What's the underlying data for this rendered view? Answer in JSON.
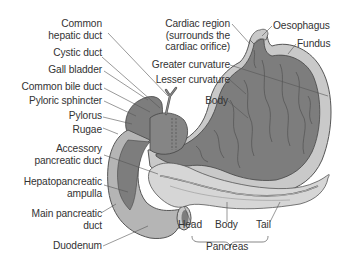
{
  "colors": {
    "mucosa": "#7d7d7d",
    "wall": "#c9c9c9",
    "wall_outline": "#555555",
    "duodenum_light": "#b5b5b5",
    "pancreas": "#d6d6d6",
    "text": "#333333",
    "leader": "#555555"
  },
  "labels_left": [
    {
      "id": "common-hepatic-duct",
      "lines": [
        "Common",
        "hepatic duct"
      ]
    },
    {
      "id": "cystic-duct",
      "lines": [
        "Cystic duct"
      ]
    },
    {
      "id": "gall-bladder",
      "lines": [
        "Gall bladder"
      ]
    },
    {
      "id": "common-bile-duct",
      "lines": [
        "Common bile duct"
      ]
    },
    {
      "id": "pyloric-sphincter",
      "lines": [
        "Pyloric sphincter"
      ]
    },
    {
      "id": "pylorus",
      "lines": [
        "Pylorus"
      ]
    },
    {
      "id": "rugae",
      "lines": [
        "Rugae"
      ]
    },
    {
      "id": "accessory-pancreatic-duct",
      "lines": [
        "Accessory",
        "pancreatic duct"
      ]
    },
    {
      "id": "hepatopancreatic-ampulla",
      "lines": [
        "Hepatopancreatic",
        "ampulla"
      ]
    },
    {
      "id": "main-pancreatic-duct",
      "lines": [
        "Main pancreatic",
        "duct"
      ]
    },
    {
      "id": "duodenum",
      "lines": [
        "Duodenum"
      ]
    }
  ],
  "labels_top": [
    {
      "id": "cardiac-region",
      "lines": [
        "Cardiac region",
        "(surrounds the",
        "cardiac orifice)"
      ]
    },
    {
      "id": "greater-curvature",
      "lines": [
        "Greater curvature"
      ]
    },
    {
      "id": "lesser-curvature",
      "lines": [
        "Lesser curvature"
      ]
    },
    {
      "id": "body-stomach",
      "lines": [
        "Body"
      ]
    },
    {
      "id": "oesophagus",
      "lines": [
        "Oesophagus"
      ]
    },
    {
      "id": "fundus",
      "lines": [
        "Fundus"
      ]
    }
  ],
  "labels_bottom": {
    "head": "Head",
    "body": "Body",
    "tail": "Tail",
    "group": "Pancreas"
  }
}
